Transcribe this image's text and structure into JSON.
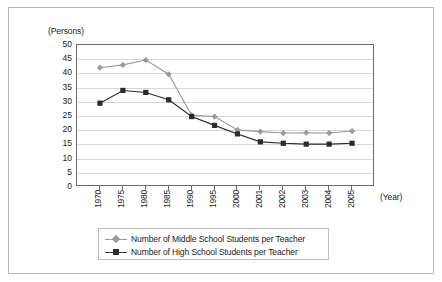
{
  "axes": {
    "y_unit_label": "(Persons)",
    "x_unit_label": "(Year)"
  },
  "legend": {
    "items": [
      {
        "label": "Number of Middle School Students per Teacher",
        "marker": "diamond-marker",
        "color": "#9a9a9a"
      },
      {
        "label": "Number of High School Students per Teacher",
        "marker": "square-marker",
        "color": "#2b2b2b"
      }
    ]
  },
  "chart_data": {
    "type": "line",
    "title": "",
    "subtitle": "",
    "xlabel": "(Year)",
    "ylabel": "(Persons)",
    "ylim": [
      0,
      50
    ],
    "yticks": [
      0,
      5,
      10,
      15,
      20,
      25,
      30,
      35,
      40,
      45,
      50
    ],
    "grid": true,
    "legend_position": "bottom",
    "categories": [
      "1970",
      "1975",
      "1980",
      "1985",
      "1990",
      "1995",
      "2000",
      "2001",
      "2002",
      "2003",
      "2004",
      "2005"
    ],
    "series": [
      {
        "name": "Number of Middle School Students per Teacher",
        "color": "#9a9a9a",
        "marker": "diamond",
        "values": [
          42.0,
          43.0,
          44.7,
          39.7,
          25.3,
          24.8,
          20.1,
          19.5,
          19.0,
          19.1,
          19.0,
          19.7
        ]
      },
      {
        "name": "Number of High School Students per Teacher",
        "color": "#2b2b2b",
        "marker": "square",
        "values": [
          29.5,
          34.0,
          33.3,
          30.7,
          24.8,
          21.7,
          18.7,
          15.9,
          15.4,
          15.1,
          15.1,
          15.4
        ]
      }
    ]
  }
}
